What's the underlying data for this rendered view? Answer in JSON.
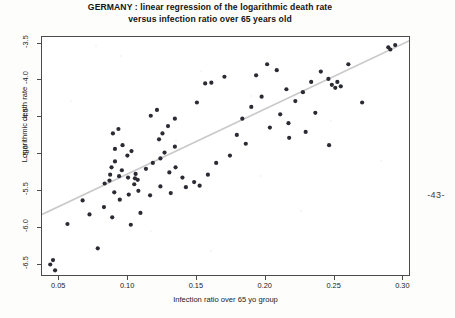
{
  "page": {
    "page_number": "-43-",
    "background": "#fdfdfc"
  },
  "chart_data": {
    "type": "scatter",
    "title": "GERMANY : linear regression of the logarithmic death rate versus infection ratio over 65 years old",
    "title_line1": "GERMANY : linear regression of the logarithmic death rate",
    "title_line2": "versus infection ratio over 65 years old",
    "xlabel": "Infection ratio over 65 yo group",
    "ylabel": "Logarithmic death rate",
    "xlim": [
      0.0375,
      0.3055
    ],
    "ylim": [
      -6.67,
      -3.41
    ],
    "xticks": [
      0.05,
      0.1,
      0.15,
      0.2,
      0.25,
      0.3
    ],
    "xticklabels": [
      "0.05",
      "0.10",
      "0.15",
      "0.20",
      "0.25",
      "0.30"
    ],
    "yticks": [
      -3.5,
      -4.0,
      -4.5,
      -5.0,
      -5.5,
      -6.0,
      -6.5
    ],
    "yticklabels": [
      "-3.5",
      "-4.0",
      "-4.5",
      "-5.0",
      "-5.5",
      "-6.0",
      "-6.5"
    ],
    "grid": false,
    "legend": null,
    "marker_color": "#2b2b33",
    "marker_size": 2.1,
    "line_color": "#c9c9c9",
    "line_width": 1.6,
    "regression_line": {
      "x": [
        0.0375,
        0.3055
      ],
      "y": [
        -5.82,
        -3.45
      ],
      "slope": 8.84,
      "intercept": -6.15
    },
    "series": [
      {
        "name": "NUTS regions",
        "points": [
          [
            0.0435,
            -6.5
          ],
          [
            0.0455,
            -6.44
          ],
          [
            0.047,
            -6.58
          ],
          [
            0.078,
            -6.28
          ],
          [
            0.056,
            -5.95
          ],
          [
            0.072,
            -5.82
          ],
          [
            0.0885,
            -5.86
          ],
          [
            0.102,
            -5.96
          ],
          [
            0.109,
            -5.8
          ],
          [
            0.067,
            -5.63
          ],
          [
            0.0825,
            -5.72
          ],
          [
            0.094,
            -5.62
          ],
          [
            0.09,
            -5.52
          ],
          [
            0.1005,
            -5.55
          ],
          [
            0.1075,
            -5.5
          ],
          [
            0.116,
            -5.56
          ],
          [
            0.1235,
            -5.44
          ],
          [
            0.131,
            -5.53
          ],
          [
            0.083,
            -5.4
          ],
          [
            0.0865,
            -5.36
          ],
          [
            0.087,
            -5.28
          ],
          [
            0.088,
            -5.18
          ],
          [
            0.0905,
            -5.1
          ],
          [
            0.0955,
            -5.22
          ],
          [
            0.0935,
            -5.3
          ],
          [
            0.1,
            -5.32
          ],
          [
            0.1045,
            -5.41
          ],
          [
            0.105,
            -5.33
          ],
          [
            0.1055,
            -5.27
          ],
          [
            0.107,
            -5.35
          ],
          [
            0.0995,
            -5.02
          ],
          [
            0.1025,
            -4.96
          ],
          [
            0.0905,
            -4.93
          ],
          [
            0.096,
            -4.88
          ],
          [
            0.089,
            -4.72
          ],
          [
            0.093,
            -4.66
          ],
          [
            0.113,
            -5.2
          ],
          [
            0.118,
            -5.12
          ],
          [
            0.1235,
            -5.06
          ],
          [
            0.13,
            -5.25
          ],
          [
            0.1345,
            -5.18
          ],
          [
            0.1395,
            -5.32
          ],
          [
            0.142,
            -5.45
          ],
          [
            0.148,
            -5.38
          ],
          [
            0.152,
            -5.43
          ],
          [
            0.1265,
            -4.98
          ],
          [
            0.134,
            -4.9
          ],
          [
            0.1225,
            -4.8
          ],
          [
            0.125,
            -4.72
          ],
          [
            0.129,
            -4.62
          ],
          [
            0.134,
            -4.52
          ],
          [
            0.1165,
            -4.48
          ],
          [
            0.121,
            -4.4
          ],
          [
            0.15,
            -4.3
          ],
          [
            0.156,
            -4.04
          ],
          [
            0.1605,
            -4.03
          ],
          [
            0.17,
            -3.95
          ],
          [
            0.183,
            -4.52
          ],
          [
            0.1895,
            -4.36
          ],
          [
            0.197,
            -4.22
          ],
          [
            0.193,
            -3.93
          ],
          [
            0.201,
            -3.78
          ],
          [
            0.208,
            -3.86
          ],
          [
            0.215,
            -4.12
          ],
          [
            0.2215,
            -4.28
          ],
          [
            0.227,
            -4.16
          ],
          [
            0.2105,
            -4.46
          ],
          [
            0.2165,
            -4.58
          ],
          [
            0.203,
            -4.64
          ],
          [
            0.179,
            -4.74
          ],
          [
            0.1855,
            -4.86
          ],
          [
            0.174,
            -5.02
          ],
          [
            0.164,
            -5.12
          ],
          [
            0.158,
            -5.28
          ],
          [
            0.233,
            -4.02
          ],
          [
            0.24,
            -3.88
          ],
          [
            0.2455,
            -3.98
          ],
          [
            0.248,
            -4.06
          ],
          [
            0.2505,
            -4.1
          ],
          [
            0.252,
            -4.02
          ],
          [
            0.2545,
            -4.08
          ],
          [
            0.236,
            -4.44
          ],
          [
            0.229,
            -4.7
          ],
          [
            0.217,
            -4.78
          ],
          [
            0.26,
            -3.78
          ],
          [
            0.289,
            -3.55
          ],
          [
            0.2905,
            -3.58
          ],
          [
            0.294,
            -3.52
          ],
          [
            0.27,
            -4.3
          ],
          [
            0.246,
            -4.88
          ]
        ]
      }
    ]
  }
}
